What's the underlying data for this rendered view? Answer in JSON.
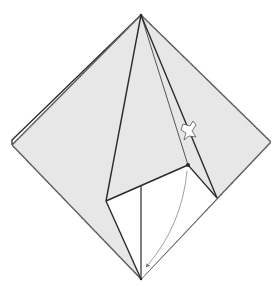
{
  "diagram": {
    "type": "origami-fold-step",
    "description": "Square base (diamond) with one flap partially folded; a squash/push arrow and a curved fold arrow indicate the next fold.",
    "colors": {
      "paper_colored": "#e6e6e6",
      "paper_white": "#ffffff",
      "stroke": "#2b2b2b",
      "arrow": "#777777"
    },
    "points": {
      "top": [
        141,
        15
      ],
      "left": [
        12,
        145
      ],
      "left_back": [
        12,
        140
      ],
      "right": [
        271,
        142
      ],
      "bottom": [
        141,
        279
      ],
      "flap_left": [
        106,
        201
      ],
      "flap_dot": [
        188,
        165
      ],
      "crease_right_bottom": [
        217,
        198
      ],
      "vertical_top": [
        141,
        186
      ]
    },
    "symbols": [
      {
        "name": "push-arrow",
        "kind": "hollow squash arrow",
        "position": [
          188,
          132
        ]
      },
      {
        "name": "fold-arrow",
        "kind": "curved valley-fold arrow",
        "from": [
          188,
          170
        ],
        "to": [
          146,
          268
        ]
      }
    ]
  }
}
